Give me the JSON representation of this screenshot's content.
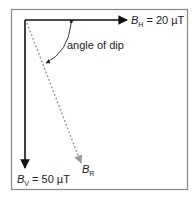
{
  "diagram": {
    "horizontal_vector": {
      "symbol": "B",
      "subscript": "H",
      "value": " = 20 µT"
    },
    "vertical_vector": {
      "symbol": "B",
      "subscript": "V",
      "value": " = 50 µT"
    },
    "resultant_vector": {
      "symbol": "B",
      "subscript": "R"
    },
    "angle_label": "angle of dip",
    "colors": {
      "frame": "#888888",
      "vector": "#111111",
      "resultant": "#999999"
    }
  }
}
